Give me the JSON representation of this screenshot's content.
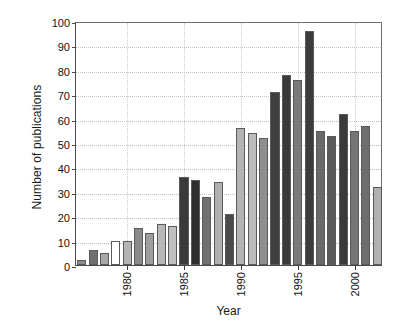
{
  "chart_data": {
    "type": "bar",
    "title": "",
    "xlabel": "Year",
    "ylabel": "Number of publications",
    "ylim": [
      0,
      100
    ],
    "ytick_step": 10,
    "yticks": [
      0,
      10,
      20,
      30,
      40,
      50,
      60,
      70,
      80,
      90,
      100
    ],
    "xticks": [
      "1980",
      "1985",
      "1990",
      "1995",
      "2000"
    ],
    "xtick_values": [
      1980,
      1985,
      1990,
      1995,
      2000
    ],
    "grid": "horizontal-and-vertical-dotted",
    "legend": "none",
    "categories": [
      1976,
      1977,
      1978,
      1979,
      1980,
      1981,
      1982,
      1983,
      1984,
      1985,
      1986,
      1987,
      1988,
      1989,
      1990,
      1991,
      1992,
      1993,
      1994,
      1995,
      1996,
      1997,
      1998,
      1999,
      2000,
      2001,
      2002
    ],
    "values": [
      2,
      6,
      5,
      10,
      10,
      15,
      13,
      17,
      16,
      36,
      35,
      28,
      34,
      21,
      56,
      54,
      52,
      71,
      78,
      76,
      96,
      55,
      53,
      62,
      55,
      57,
      32
    ],
    "bar_colors": [
      "#8c8c8c",
      "#707070",
      "#a8a8a8",
      "#ffffff",
      "#b4b4b4",
      "#8a8a8a",
      "#9e9e9e",
      "#b8b8b8",
      "#c0c0c0",
      "#3a3a3a",
      "#2e2e2e",
      "#707070",
      "#b0b0b0",
      "#4a4a4a",
      "#b4b4b4",
      "#bcbcbc",
      "#8f8f8f",
      "#3f3f3f",
      "#3a3a3a",
      "#7a7a7a",
      "#3c3c3c",
      "#6a6a6a",
      "#595959",
      "#3a3a3a",
      "#757575",
      "#6e6e6e",
      "#b0b0b0"
    ]
  }
}
